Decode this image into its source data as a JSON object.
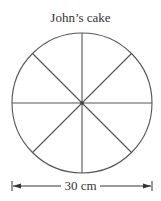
{
  "diagram": {
    "title": "John’s cake",
    "shape": "circle divided into 8 equal slices",
    "slices": 8,
    "dimension_label": "30 cm",
    "dimension_meaning": "diameter",
    "stroke_color": "#555555"
  }
}
